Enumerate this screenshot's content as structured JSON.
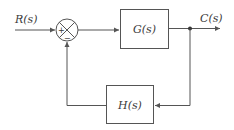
{
  "diagram": {
    "type": "feedback-control-block-diagram",
    "input": {
      "label": "R(s)"
    },
    "output": {
      "label": "C(s)"
    },
    "summing_junction": {
      "plus_sign": "+",
      "minus_sign": "−"
    },
    "forward_block": {
      "label": "G(s)"
    },
    "feedback_block": {
      "label": "H(s)"
    },
    "colors": {
      "line": "#555555",
      "text": "#3a3a3a",
      "background": "#ffffff"
    }
  }
}
